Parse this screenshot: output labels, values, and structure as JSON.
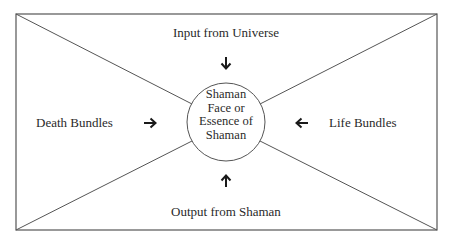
{
  "diagram": {
    "top_label": "Input from Universe",
    "bottom_label": "Output from Shaman",
    "left_label": "Death Bundles",
    "right_label": "Life Bundles",
    "center_lines": [
      "Shaman",
      "Face or",
      "Essence of",
      "Shaman"
    ],
    "arrows": {
      "top": "down-arrow-icon",
      "bottom": "up-arrow-icon",
      "left": "right-arrow-icon",
      "right": "left-arrow-icon"
    },
    "arrow_glyphs": {
      "top": "🡓",
      "bottom": "🡑",
      "left": "🡒",
      "right": "🡐"
    },
    "colors": {
      "stroke": "#555555",
      "text": "#2a2a2a",
      "background": "#ffffff"
    }
  }
}
